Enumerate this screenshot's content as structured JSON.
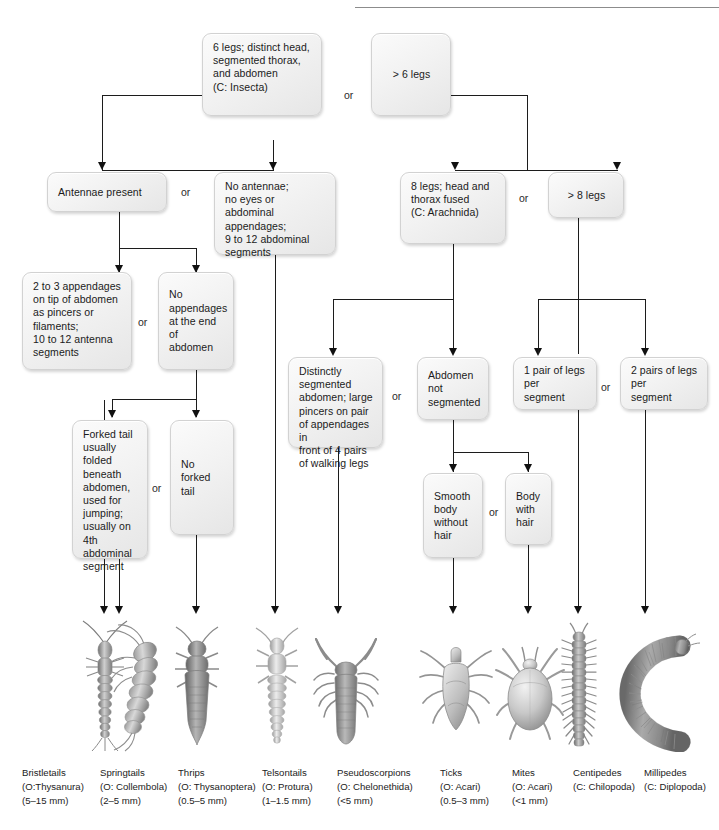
{
  "figure": {
    "kind": "dichotomous-key"
  },
  "nodes": {
    "insecta": "6 legs; distinct head, segmented thorax, and abdomen (C: Insecta)",
    "insecta_l1": "6 legs; distinct head,",
    "insecta_l2": "segmented thorax,",
    "insecta_l3": "and abdomen",
    "insecta_l4": "(C: Insecta)",
    "more6legs": "> 6 legs",
    "antennae": "Antennae present",
    "noantennae_l1": "No antennae;",
    "noantennae_l2": "no eyes or abdominal",
    "noantennae_l3": "appendages;",
    "noantennae_l4": "9 to 12 abdominal",
    "noantennae_l5": "segments",
    "arachnida_l1": "8 legs; head and",
    "arachnida_l2": "thorax fused",
    "arachnida_l3": "(C: Arachnida)",
    "more8legs": "> 8 legs",
    "append23_l1": "2 to 3 appendages",
    "append23_l2": "on tip of abdomen",
    "append23_l3": "as pincers or",
    "append23_l4": "filaments;",
    "append23_l5": "10 to 12 antenna",
    "append23_l6": "segments",
    "noappend_l1": "No",
    "noappend_l2": "appendages",
    "noappend_l3": "at the end of",
    "noappend_l4": "abdomen",
    "forked_l1": "Forked tail",
    "forked_l2": "usually folded",
    "forked_l3": "beneath",
    "forked_l4": "abdomen,",
    "forked_l5": "used for",
    "forked_l6": "jumping;",
    "forked_l7": "usually on",
    "forked_l8": "4th abdominal",
    "forked_l9": "segment",
    "noforked_l1": "No forked",
    "noforked_l2": "tail",
    "distseg_l1": "Distinctly",
    "distseg_l2": "segmented",
    "distseg_l3": "abdomen; large",
    "distseg_l4": "pincers on pair",
    "distseg_l5": "of appendages in",
    "distseg_l6": "front of 4 pairs",
    "distseg_l7": "of walking legs",
    "abdnotseg_l1": "Abdomen",
    "abdnotseg_l2": "not",
    "abdnotseg_l3": "segmented",
    "onepair_l1": "1 pair of legs",
    "onepair_l2": "per",
    "onepair_l3": "segment",
    "twopairs_l1": "2 pairs of legs",
    "twopairs_l2": "per",
    "twopairs_l3": "segment",
    "smooth_l1": "Smooth",
    "smooth_l2": "body",
    "smooth_l3": "without",
    "smooth_l4": "hair",
    "hairy_l1": "Body",
    "hairy_l2": "with",
    "hairy_l3": "hair"
  },
  "or_labels": {
    "top": "or",
    "insect1": "or",
    "insect2": "or",
    "insect3": "or",
    "arach_top": "or",
    "arach_mid": "or",
    "myriapod": "or",
    "mite": "or"
  },
  "organisms": [
    {
      "id": "bristletails",
      "common": "Bristletails",
      "taxon": "(O:Thysanura)",
      "size": "(5–15 mm)"
    },
    {
      "id": "springtails",
      "common": "Springtails",
      "taxon": "(O: Collembola)",
      "size": "(2–5 mm)"
    },
    {
      "id": "thrips",
      "common": "Thrips",
      "taxon": "(O: Thysanoptera)",
      "size": "(0.5–5 mm)"
    },
    {
      "id": "telsontails",
      "common": "Telsontails",
      "taxon": "(O: Protura)",
      "size": "(1–1.5 mm)"
    },
    {
      "id": "pseudoscorpions",
      "common": "Pseudoscorpions",
      "taxon": "(O: Chelonethida)",
      "size": "(<5 mm)"
    },
    {
      "id": "ticks",
      "common": "Ticks",
      "taxon": "(O: Acari)",
      "size": "(0.5–3 mm)"
    },
    {
      "id": "mites",
      "common": "Mites",
      "taxon": "(O: Acari)",
      "size": "(<1 mm)"
    },
    {
      "id": "centipedes",
      "common": "Centipedes",
      "taxon": "(C: Chilopoda)",
      "size": ""
    },
    {
      "id": "millipedes",
      "common": "Millipedes",
      "taxon": "(C: Diplopoda)",
      "size": ""
    }
  ],
  "colors": {
    "box_fill": "#f2f2f2",
    "box_border": "#d2d2d2",
    "line": "#1c1c1c",
    "text": "#1b1b1b",
    "illustration": "#8e8e8e"
  }
}
